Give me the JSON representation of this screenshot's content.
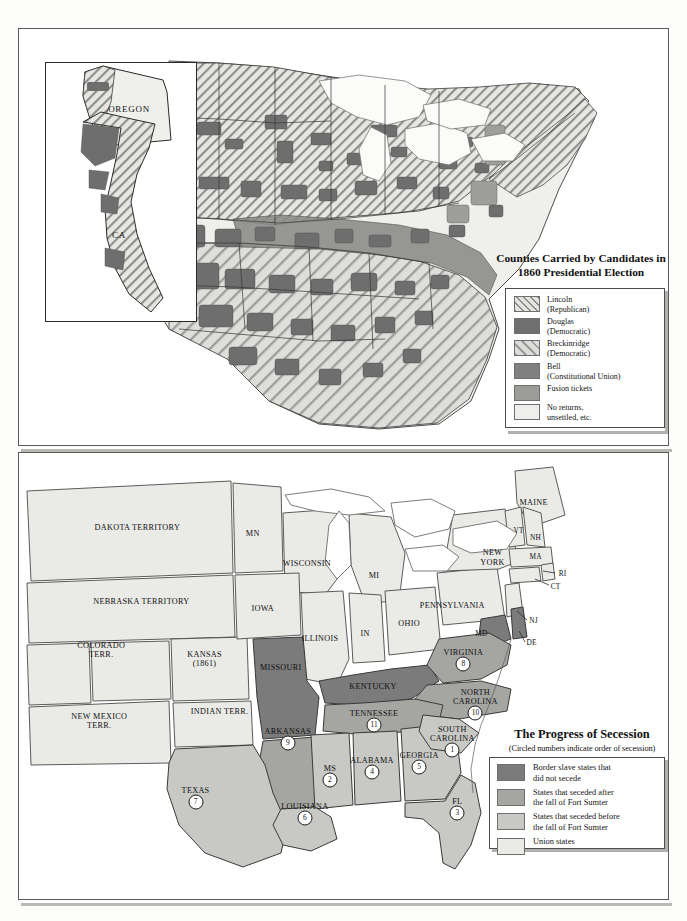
{
  "election_map": {
    "title": "Counties Carried by Candidates in 1860 Presidential Election",
    "inset": {
      "states": [
        {
          "name": "OREGON",
          "x": 100,
          "y": 90
        },
        {
          "name": "CA",
          "x": 92,
          "y": 205
        }
      ]
    },
    "legend": {
      "items": [
        {
          "key": "lincoln",
          "label": "Lincoln\n(Republican)",
          "swatch": "sw-lincoln",
          "color": "#e4e4e2"
        },
        {
          "key": "douglas",
          "label": "Douglas\n(Democratic)",
          "swatch": "sw-douglas",
          "color": "#6f6f6f"
        },
        {
          "key": "breckinridge",
          "label": "Breckinridge\n(Democratic)",
          "swatch": "sw-breck",
          "color": "#dcdcda"
        },
        {
          "key": "bell",
          "label": "Bell\n(Constitutional Union)",
          "swatch": "sw-bell",
          "color": "#808080"
        },
        {
          "key": "fusion",
          "label": "Fusion  tickets",
          "swatch": "sw-fusion",
          "color": "#9c9c99"
        },
        {
          "key": "no_returns",
          "label": "No returns,\nunsettled, etc.",
          "swatch": "sw-noreturns",
          "color": "#eeeeec"
        }
      ]
    }
  },
  "secession_map": {
    "title": "The Progress of Secession",
    "subtitle": "(Circled numbers indicate order of secession)",
    "legend": {
      "items": [
        {
          "key": "border_slave",
          "label": "Border slave states that\ndid not secede",
          "swatch": "sw-border-slave",
          "color": "#7b7b7b"
        },
        {
          "key": "after_sumter",
          "label": "States that seceded after\nthe fall of Fort Sumter",
          "swatch": "sw-after-sumter",
          "color": "#a5a5a2"
        },
        {
          "key": "before_sumter",
          "label": "States that seceded before\nthe fall of Fort Sumter",
          "swatch": "sw-before-sumter",
          "color": "#c8c8c5"
        },
        {
          "key": "union",
          "label": "Union states",
          "swatch": "sw-union",
          "color": "#eaeae7"
        }
      ]
    },
    "labels": [
      {
        "name": "DAKOTA TERRITORY",
        "x": 118,
        "y": 75,
        "size": "",
        "order": null
      },
      {
        "name": "NEBRASKA TERRITORY",
        "x": 122,
        "y": 148,
        "size": "",
        "order": null
      },
      {
        "name": "COLORADO\nTERR.",
        "x": 82,
        "y": 196,
        "size": "",
        "order": null
      },
      {
        "name": "KANSAS\n(1861)",
        "x": 185,
        "y": 205,
        "size": "",
        "order": null
      },
      {
        "name": "NEW MEXICO\nTERR.",
        "x": 80,
        "y": 267,
        "size": "",
        "order": null
      },
      {
        "name": "INDIAN TERR.",
        "x": 200,
        "y": 258,
        "size": "",
        "order": null
      },
      {
        "name": "TEXAS",
        "x": 176,
        "y": 336,
        "size": "",
        "order": 7
      },
      {
        "name": "MN",
        "x": 233,
        "y": 81,
        "size": "",
        "order": null
      },
      {
        "name": "WISCONSIN",
        "x": 287,
        "y": 111,
        "size": "",
        "order": null
      },
      {
        "name": "MI",
        "x": 354,
        "y": 122,
        "size": "",
        "order": null
      },
      {
        "name": "IOWA",
        "x": 243,
        "y": 155,
        "size": "",
        "order": null
      },
      {
        "name": "ILLINOIS",
        "x": 300,
        "y": 185,
        "size": "",
        "order": null
      },
      {
        "name": "IN",
        "x": 345,
        "y": 180,
        "size": "",
        "order": null
      },
      {
        "name": "OHIO",
        "x": 389,
        "y": 170,
        "size": "",
        "order": null
      },
      {
        "name": "MISSOURI",
        "x": 261,
        "y": 214,
        "size": "",
        "order": null
      },
      {
        "name": "KENTUCKY",
        "x": 353,
        "y": 233,
        "size": "",
        "order": null
      },
      {
        "name": "TENNESSEE",
        "x": 354,
        "y": 260,
        "size": "",
        "order": 11
      },
      {
        "name": "ARKANSAS",
        "x": 268,
        "y": 278,
        "size": "",
        "order": 9
      },
      {
        "name": "MS",
        "x": 310,
        "y": 315,
        "size": "",
        "order": 2
      },
      {
        "name": "ALABAMA",
        "x": 352,
        "y": 307,
        "size": "",
        "order": 4
      },
      {
        "name": "GEORGIA",
        "x": 399,
        "y": 302,
        "size": "",
        "order": 5
      },
      {
        "name": "LOUISIANA",
        "x": 285,
        "y": 352,
        "size": "",
        "order": 6
      },
      {
        "name": "FL",
        "x": 437,
        "y": 347,
        "size": "",
        "order": 3
      },
      {
        "name": "SOUTH\nCAROLINA",
        "x": 432,
        "y": 280,
        "size": "",
        "order": 1
      },
      {
        "name": "NORTH\nCAROLINA",
        "x": 455,
        "y": 243,
        "size": "",
        "order": 10
      },
      {
        "name": "VIRGINIA",
        "x": 443,
        "y": 199,
        "size": "",
        "order": 8
      },
      {
        "name": "PENNSYLVANIA",
        "x": 432,
        "y": 152,
        "size": "",
        "order": null
      },
      {
        "name": "NEW\nYORK",
        "x": 472,
        "y": 104,
        "size": "",
        "order": null
      },
      {
        "name": "MAINE",
        "x": 513,
        "y": 50,
        "size": "",
        "order": null
      },
      {
        "name": "VT",
        "x": 498,
        "y": 78,
        "size": "sm",
        "order": null
      },
      {
        "name": "NH",
        "x": 515,
        "y": 85,
        "size": "sm",
        "order": null
      },
      {
        "name": "MA",
        "x": 515,
        "y": 104,
        "size": "sm",
        "order": null
      },
      {
        "name": "RI",
        "x": 542,
        "y": 120,
        "size": "sm",
        "order": null
      },
      {
        "name": "CT",
        "x": 535,
        "y": 133,
        "size": "sm",
        "order": null
      },
      {
        "name": "NJ",
        "x": 513,
        "y": 167,
        "size": "sm",
        "order": null
      },
      {
        "name": "DE",
        "x": 511,
        "y": 189,
        "size": "sm",
        "order": null
      },
      {
        "name": "MD",
        "x": 461,
        "y": 180,
        "size": "sm",
        "order": null
      }
    ]
  }
}
